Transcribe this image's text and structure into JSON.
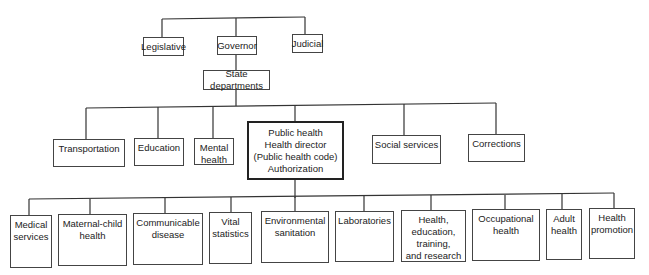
{
  "top_level": [
    {
      "id": "legislative",
      "label": "Legislative"
    },
    {
      "id": "governor",
      "label": "Governor"
    },
    {
      "id": "judicial",
      "label": "Judicial"
    }
  ],
  "state_departments": {
    "id": "state-departments",
    "label": "State departments"
  },
  "departments": [
    {
      "id": "transportation",
      "label": "Transportation"
    },
    {
      "id": "education",
      "label": "Education"
    },
    {
      "id": "mental-health",
      "label": "Mental\nhealth"
    },
    {
      "id": "public-health",
      "label": "Public health\nHealth director\n(Public health code)\nAuthorization",
      "emphasized": true
    },
    {
      "id": "social-services",
      "label": "Social services"
    },
    {
      "id": "corrections",
      "label": "Corrections"
    }
  ],
  "public_health_divisions": [
    {
      "id": "medical-services",
      "label": "Medical\nservices"
    },
    {
      "id": "maternal-child-health",
      "label": "Maternal-child\nhealth"
    },
    {
      "id": "communicable-disease",
      "label": "Communicable\ndisease"
    },
    {
      "id": "vital-statistics",
      "label": "Vital\nstatistics"
    },
    {
      "id": "environmental-sanitation",
      "label": "Environmental\nsanitation"
    },
    {
      "id": "laboratories",
      "label": "Laboratories"
    },
    {
      "id": "health-education",
      "label": "Health,\neducation,\ntraining,\nand research"
    },
    {
      "id": "occupational-health",
      "label": "Occupational\nhealth"
    },
    {
      "id": "adult-health",
      "label": "Adult\nhealth"
    },
    {
      "id": "health-promotion",
      "label": "Health\npromotion"
    }
  ]
}
